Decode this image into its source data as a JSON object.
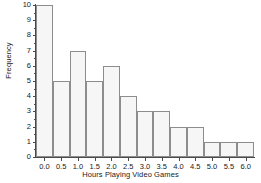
{
  "chart_data": {
    "type": "bar",
    "title": "",
    "xlabel": "Hours Playing Video Games",
    "ylabel": "Frequency",
    "categories": [
      "0.0",
      "0.5",
      "1.0",
      "1.5",
      "2.0",
      "2.5",
      "3.0",
      "3.5",
      "4.0",
      "4.5",
      "5.0",
      "5.5",
      "6.0"
    ],
    "values": [
      10,
      5,
      7,
      5,
      6,
      4,
      3,
      3,
      2,
      2,
      1,
      1,
      1
    ],
    "xtick_labels": [
      "0.0",
      "0.5",
      "1.0",
      "1.5",
      "2.0",
      "2.5",
      "3.0",
      "3.5",
      "4.0",
      "4.5",
      "5.0",
      "5.5",
      "6.0"
    ],
    "ytick_labels": [
      "0",
      "1",
      "2",
      "3",
      "4",
      "5",
      "6",
      "7",
      "8",
      "9",
      "10"
    ],
    "ylim": [
      0,
      10
    ],
    "xlim": [
      -0.25,
      6.25
    ],
    "bin_width": 0.5,
    "grid": false,
    "legend": false,
    "bar_fill_color": "#f6f6f6",
    "bar_edge_color": "#8d8d8d",
    "axis_color": "#4a4a4a",
    "text_color": "#1a1a1a",
    "background_color": "#ffffff"
  }
}
